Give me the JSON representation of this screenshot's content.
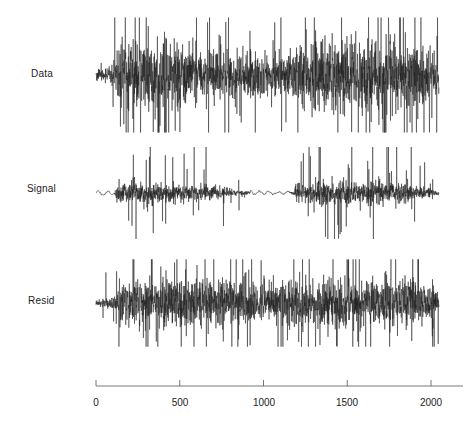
{
  "chart_data": {
    "type": "line",
    "title": "",
    "layout": "three vertically stacked time-series panels sharing one x-axis",
    "xlabel": "",
    "ylabel": "",
    "xlim": [
      0,
      2200
    ],
    "x_ticks": [
      0,
      500,
      1000,
      1500,
      2000
    ],
    "x_tick_labels": [
      "0",
      "500",
      "1000",
      "1500",
      "2000"
    ],
    "n_samples": 2048,
    "grid": false,
    "legend": "none",
    "series": [
      {
        "name": "Data",
        "label": "Data",
        "description": "Observed noisy time series; small amplitude for t<100, large bursty oscillations thereafter with a quieter stretch near t=1000-1200 and higher activity around t=1250-1550 and 1800-1900",
        "envelope": [
          {
            "t": 0,
            "amp": 0.12
          },
          {
            "t": 100,
            "amp": 0.15
          },
          {
            "t": 130,
            "amp": 0.85
          },
          {
            "t": 400,
            "amp": 0.75
          },
          {
            "t": 700,
            "amp": 0.6
          },
          {
            "t": 1000,
            "amp": 0.5
          },
          {
            "t": 1150,
            "amp": 0.45
          },
          {
            "t": 1250,
            "amp": 0.8
          },
          {
            "t": 1400,
            "amp": 0.95
          },
          {
            "t": 1600,
            "amp": 0.8
          },
          {
            "t": 1850,
            "amp": 0.9
          },
          {
            "t": 2048,
            "amp": 0.6
          }
        ],
        "peak_amplitude_px": 50
      },
      {
        "name": "Signal",
        "label": "Signal",
        "description": "Extracted signal; nearly flat smooth wiggle at start and around t=1000-1200, sparse sharp bursts elsewhere",
        "envelope": [
          {
            "t": 0,
            "amp": 0.05
          },
          {
            "t": 110,
            "amp": 0.05
          },
          {
            "t": 130,
            "amp": 0.75
          },
          {
            "t": 260,
            "amp": 0.6
          },
          {
            "t": 450,
            "amp": 0.5
          },
          {
            "t": 700,
            "amp": 0.45
          },
          {
            "t": 850,
            "amp": 0.2
          },
          {
            "t": 950,
            "amp": 0.06
          },
          {
            "t": 1150,
            "amp": 0.06
          },
          {
            "t": 1270,
            "amp": 0.8
          },
          {
            "t": 1500,
            "amp": 0.7
          },
          {
            "t": 1800,
            "amp": 0.7
          },
          {
            "t": 2000,
            "amp": 0.25
          },
          {
            "t": 2048,
            "amp": 0.1
          }
        ],
        "burst_probability": 0.08,
        "peak_amplitude_px": 40
      },
      {
        "name": "Resid",
        "label": "Resid",
        "description": "Residuals (Data minus Signal); roughly stationary noise across the full range after an initial quiet segment",
        "envelope": [
          {
            "t": 0,
            "amp": 0.12
          },
          {
            "t": 100,
            "amp": 0.18
          },
          {
            "t": 140,
            "amp": 0.7
          },
          {
            "t": 500,
            "amp": 0.75
          },
          {
            "t": 1000,
            "amp": 0.65
          },
          {
            "t": 1400,
            "amp": 0.75
          },
          {
            "t": 1800,
            "amp": 0.75
          },
          {
            "t": 2048,
            "amp": 0.6
          }
        ],
        "peak_amplitude_px": 38
      }
    ]
  },
  "panels": [
    {
      "label": "Data",
      "baseline_y": 75
    },
    {
      "label": "Signal",
      "baseline_y": 193
    },
    {
      "label": "Resid",
      "baseline_y": 303
    }
  ],
  "axis": {
    "tick_labels": [
      "0",
      "500",
      "1000",
      "1500",
      "2000"
    ]
  },
  "colors": {
    "trace": "#1c1c1c",
    "axis": "#555555",
    "background": "#ffffff"
  }
}
